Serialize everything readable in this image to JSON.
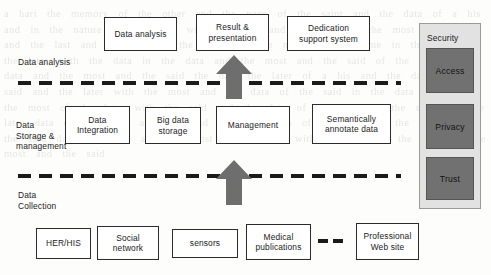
{
  "diagram": {
    "background_color": "#fdfdfb",
    "watermark_text": "a hari the memory of the other and the page of the saint and the data of a his and in the nature of the later with the said and the data of the most of a his and the last and the said of the data and the most of the same in the said and the later with the data in the data and the most and the said of the later the data and the most and the said the data the later of a his and the data of the said and the later with the most and the data of the said in the data and a his the most of the later with the said and the data of the most in the said and the later data of the most and the said with the data of the later in the most and the said data the later and the most of the said with the data of the later in the most and the said",
    "tiers": [
      {
        "id": "data-analysis",
        "label": "Data analysis",
        "label_x": 18,
        "label_y": 57,
        "nodes": [
          {
            "id": "data-analysis-node",
            "label": "Data analysis",
            "x": 104,
            "y": 17,
            "w": 73,
            "h": 34
          },
          {
            "id": "result-presentation",
            "label": "Result &\npresentation",
            "x": 196,
            "y": 14,
            "w": 73,
            "h": 37
          },
          {
            "id": "dedication-support-system",
            "label": "Dedication\nsupport system",
            "x": 287,
            "y": 16,
            "w": 83,
            "h": 35
          }
        ]
      },
      {
        "id": "data-storage-management",
        "label": "Data\nStorage &\nmanagement",
        "label_x": 16,
        "label_y": 120,
        "nodes": [
          {
            "id": "data-integration",
            "label": "Data\nIntegration",
            "x": 65,
            "y": 106,
            "w": 65,
            "h": 38
          },
          {
            "id": "big-data-storage",
            "label": "Big data\nstorage",
            "x": 145,
            "y": 107,
            "w": 56,
            "h": 37
          },
          {
            "id": "management",
            "label": "Management",
            "x": 216,
            "y": 106,
            "w": 74,
            "h": 38
          },
          {
            "id": "semantically-annotate-data",
            "label": "Semantically\nannotate data",
            "x": 312,
            "y": 104,
            "w": 79,
            "h": 40
          }
        ]
      },
      {
        "id": "data-collection",
        "label": "Data\nCollection",
        "label_x": 18,
        "label_y": 190,
        "nodes": [
          {
            "id": "her-his",
            "label": "HER/HIS",
            "x": 36,
            "y": 228,
            "w": 55,
            "h": 31
          },
          {
            "id": "social-network",
            "label": "Social\nnetwork",
            "x": 97,
            "y": 226,
            "w": 62,
            "h": 34
          },
          {
            "id": "sensors",
            "label": "sensors",
            "x": 172,
            "y": 229,
            "w": 66,
            "h": 29
          },
          {
            "id": "medical-publications",
            "label": "Medical\npublications",
            "x": 246,
            "y": 224,
            "w": 65,
            "h": 36
          },
          {
            "id": "professional-web-site",
            "label": "Professional\nWeb site",
            "x": 356,
            "y": 223,
            "w": 63,
            "h": 37
          }
        ]
      }
    ],
    "dividers": [
      {
        "id": "divider-analysis-storage",
        "x": 18,
        "y": 81,
        "w": 383
      },
      {
        "id": "divider-storage-collection",
        "x": 18,
        "y": 174,
        "w": 383
      }
    ],
    "arrows": [
      {
        "id": "arrow-storage-to-analysis",
        "x": 216,
        "y": 55,
        "w": 36,
        "h": 44,
        "color": "#6e6e6e"
      },
      {
        "id": "arrow-collection-to-storage",
        "x": 216,
        "y": 160,
        "w": 36,
        "h": 45,
        "color": "#6e6e6e"
      }
    ],
    "mini_dashes": {
      "id": "link-dashes",
      "x": 318,
      "y": 239,
      "count": 2
    },
    "security_panel": {
      "id": "security-panel",
      "title": "Security",
      "x": 419,
      "y": 23,
      "w": 62,
      "h": 186,
      "title_x": 427,
      "title_y": 33,
      "panel_color": "#e2e2e2",
      "item_color": "#717171",
      "items": [
        {
          "id": "security-access",
          "label": "Access",
          "x": 426,
          "y": 48,
          "w": 48,
          "h": 45
        },
        {
          "id": "security-privacy",
          "label": "Privacy",
          "x": 426,
          "y": 104,
          "w": 48,
          "h": 45
        },
        {
          "id": "security-trust",
          "label": "Trust",
          "x": 426,
          "y": 157,
          "w": 48,
          "h": 43
        }
      ]
    }
  }
}
